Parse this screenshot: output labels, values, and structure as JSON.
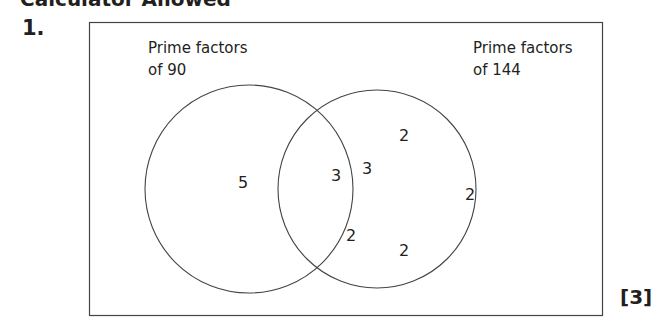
{
  "header": {
    "cut_title": "Calculator Allowed"
  },
  "question": {
    "number": "1.",
    "marks": "[3]"
  },
  "diagram": {
    "type": "venn",
    "left_set": {
      "label_line1": "Prime factors",
      "label_line2": "of 90",
      "only": [
        "5"
      ]
    },
    "right_set": {
      "label_line1": "Prime factors",
      "label_line2": "of 144",
      "only": [
        "2",
        "2",
        "2"
      ]
    },
    "intersection": [
      "3",
      "3",
      "2"
    ]
  }
}
